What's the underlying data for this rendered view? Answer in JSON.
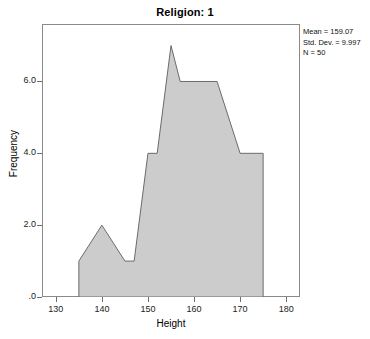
{
  "chart_data": {
    "type": "area",
    "title": "Religion: 1",
    "xlabel": "Height",
    "ylabel": "Frequency",
    "xlim": [
      127,
      183
    ],
    "ylim": [
      0,
      7.6
    ],
    "xticks": [
      130,
      140,
      150,
      160,
      170,
      180
    ],
    "xtick_labels": [
      "130",
      "140",
      "150",
      "160",
      "170",
      "180"
    ],
    "yticks": [
      0,
      2,
      4,
      6
    ],
    "ytick_labels": [
      ".0",
      "2.0",
      "4.0",
      "6.0"
    ],
    "grid": false,
    "legend": "none",
    "fill_color": "#cccccc",
    "line_color": "#6b6b6b",
    "x": [
      135,
      135,
      140,
      145,
      145,
      150,
      150,
      155,
      157,
      165,
      170,
      175,
      175
    ],
    "y": [
      0,
      1,
      2,
      1,
      1,
      4,
      4,
      7,
      6,
      6,
      4,
      4,
      0
    ],
    "points": [
      {
        "x": 135,
        "y": 0
      },
      {
        "x": 135,
        "y": 1
      },
      {
        "x": 140,
        "y": 2
      },
      {
        "x": 145,
        "y": 1
      },
      {
        "x": 147,
        "y": 1
      },
      {
        "x": 150,
        "y": 4
      },
      {
        "x": 152,
        "y": 4
      },
      {
        "x": 155,
        "y": 7
      },
      {
        "x": 157,
        "y": 6
      },
      {
        "x": 165,
        "y": 6
      },
      {
        "x": 170,
        "y": 4
      },
      {
        "x": 175,
        "y": 4
      },
      {
        "x": 175,
        "y": 0
      }
    ]
  },
  "stats": {
    "mean": "Mean = 159.07",
    "std_dev": "Std. Dev. = 9.997",
    "n": "N = 50"
  }
}
